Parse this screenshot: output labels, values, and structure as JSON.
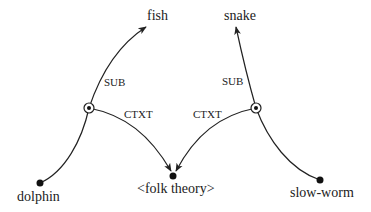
{
  "diagram": {
    "type": "concept-network",
    "nodes": {
      "fish": {
        "label": "fish"
      },
      "snake": {
        "label": "snake"
      },
      "dolphin": {
        "label": "dolphin"
      },
      "slow_worm": {
        "label": "slow-worm"
      },
      "folk_theory": {
        "label": "<folk theory>"
      }
    },
    "edges": {
      "left_sub": {
        "label": "SUB",
        "from": "dolphin-hub",
        "to": "fish"
      },
      "left_ctxt": {
        "label": "CTXT",
        "from": "dolphin-hub",
        "to": "folk_theory"
      },
      "right_sub": {
        "label": "SUB",
        "from": "slow-worm-hub",
        "to": "snake"
      },
      "right_ctxt": {
        "label": "CTXT",
        "from": "slow-worm-hub",
        "to": "folk_theory"
      }
    },
    "colors": {
      "stroke": "#222222",
      "node": "#111111",
      "background": "#ffffff"
    }
  }
}
